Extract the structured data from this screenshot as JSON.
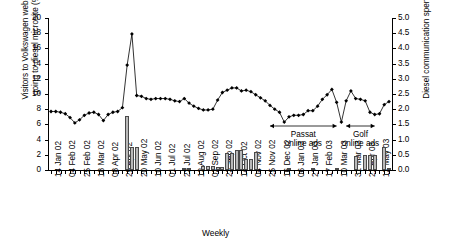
{
  "chart_data": {
    "type": "line",
    "title": "",
    "xlabel": "Weekly",
    "ylabel": "Visitors to Volkswagen website\ngoing to diesel microsite (%)",
    "y2label": "Diesel communication spend (£ms)",
    "ylim": [
      0,
      20
    ],
    "yticks": [
      "0",
      "2",
      "4",
      "6",
      "8",
      "10",
      "12",
      "14",
      "16",
      "18",
      "20"
    ],
    "y2lim": [
      0,
      5.0
    ],
    "y2ticks": [
      "0.0",
      "0.5",
      "1.0",
      "1.5",
      "2.0",
      "2.5",
      "3.0",
      "3.5",
      "4.0",
      "4.5",
      "5.0"
    ],
    "grid": false,
    "legend": "none",
    "xtick_labels": [
      "14 Jan 02",
      "04 Feb 02",
      "25 Feb 02",
      "18 Mar 02",
      "08 Apr 02",
      "29 Apr 02",
      "20 May 02",
      "10 Jun 02",
      "01 Jul 02",
      "22 Jul 02",
      "12 Aug 02",
      "02 Sep 02",
      "23 Sep 02",
      "14 Oct 02",
      "04 Nov 02",
      "25 Nov 02",
      "16 Dec 02",
      "06 Jan 03",
      "27 Jan 03",
      "17 Feb 03",
      "10 Mar 03",
      "31 Mar 03",
      "21 Apr 03",
      "12 May 03"
    ],
    "xtick_label_every": 3,
    "n_points": 72,
    "series": [
      {
        "name": "Visitors to Volkswagen website going to diesel microsite (%)",
        "axis": "left",
        "type": "line",
        "marker": "diamond",
        "values": [
          7.7,
          7.7,
          7.6,
          7.4,
          6.9,
          6.2,
          6.6,
          7.2,
          7.5,
          7.6,
          7.3,
          6.5,
          7.3,
          7.6,
          7.7,
          8.2,
          13.8,
          17.9,
          9.8,
          9.7,
          9.4,
          9.3,
          9.4,
          9.4,
          9.4,
          9.3,
          9.1,
          9.0,
          9.4,
          8.8,
          8.4,
          8.1,
          7.9,
          7.9,
          8.0,
          9.2,
          10.2,
          10.5,
          10.8,
          10.8,
          10.4,
          10.5,
          10.3,
          9.9,
          9.5,
          9.1,
          8.5,
          8.0,
          7.6,
          6.3,
          7.0,
          7.2,
          7.2,
          7.3,
          7.8,
          7.8,
          8.4,
          9.3,
          9.9,
          10.6,
          8.9,
          6.3,
          9.1,
          10.4,
          9.4,
          9.3,
          9.1,
          7.6,
          7.3,
          7.4,
          8.6,
          9.0
        ]
      },
      {
        "name": "Diesel communication spend (£ms)",
        "axis": "right",
        "type": "bar",
        "values": [
          0,
          0,
          0,
          0,
          0,
          0,
          0,
          0,
          0,
          0,
          0,
          0,
          0,
          0,
          0,
          0,
          1.78,
          0.75,
          0.75,
          0,
          0,
          0,
          0,
          0,
          0,
          0,
          0,
          0,
          0.05,
          0.05,
          0,
          0,
          0.13,
          0.12,
          0.12,
          0.11,
          0.1,
          0.55,
          0.55,
          0.67,
          0.67,
          0.35,
          0.35,
          0.58,
          0,
          0,
          0,
          0,
          0,
          0,
          0.08,
          0,
          0,
          0,
          0,
          0.05,
          0,
          0,
          0,
          0,
          0.05,
          0,
          0,
          0,
          0.46,
          0,
          0.5,
          0.5,
          0.5,
          0,
          0.75,
          0.05
        ]
      }
    ],
    "annotations": [
      {
        "id": "passat",
        "label": "Passat\nonline ads",
        "arrow_from_x": 46,
        "arrow_to_x": 60
      },
      {
        "id": "golf",
        "label": "Golf\nonline ads",
        "arrow_from_x": 62,
        "arrow_to_x": 68
      }
    ]
  }
}
